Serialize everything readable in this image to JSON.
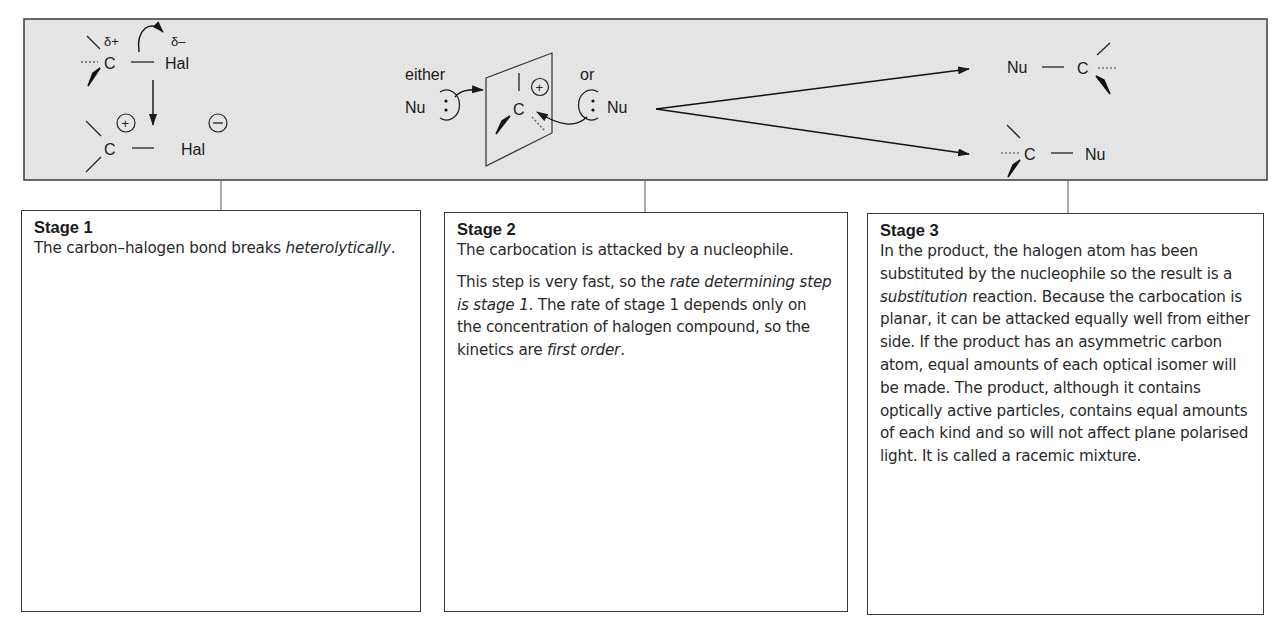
{
  "mechanism": {
    "colors": {
      "panel_bg": "#e6e6e6",
      "line": "#2a2a2a",
      "box_border": "#3a3a3a",
      "text": "#2a2a2a"
    },
    "stage1_diagram": {
      "delta_plus": "δ+",
      "delta_minus": "δ–",
      "carbon": "C",
      "halogen": "Hal",
      "carbon_ion": "C",
      "halide_ion": "Hal",
      "plus_sign": "+",
      "minus_sign": "−"
    },
    "stage2_diagram": {
      "either_label": "either",
      "or_label": "or",
      "nucleophile_left": "Nu",
      "nucleophile_right": "Nu",
      "carbocation": "C",
      "plus_sign": "+",
      "lone_pair": ":"
    },
    "stage3_diagram": {
      "product_top_nu": "Nu",
      "product_top_c": "C",
      "product_bottom_c": "C",
      "product_bottom_nu": "Nu"
    }
  },
  "stages": [
    {
      "title": "Stage 1",
      "paragraphs": [
        [
          {
            "text": "The carbon–halogen bond breaks ",
            "italic": false
          },
          {
            "text": "heterolytically",
            "italic": true
          },
          {
            "text": ".",
            "italic": false
          }
        ]
      ]
    },
    {
      "title": "Stage 2",
      "paragraphs": [
        [
          {
            "text": "The carbocation is attacked by a nucleophile.",
            "italic": false
          }
        ],
        [
          {
            "text": "This step is very fast, so the ",
            "italic": false
          },
          {
            "text": "rate determining step is stage 1",
            "italic": true
          },
          {
            "text": ". The rate of stage 1 depends only on the concentration of halogen compound, so the kinetics are ",
            "italic": false
          },
          {
            "text": "first order",
            "italic": true
          },
          {
            "text": ".",
            "italic": false
          }
        ]
      ]
    },
    {
      "title": "Stage 3",
      "paragraphs": [
        [
          {
            "text": "In the product, the halogen atom has been substituted by the nucleophile so the result is a ",
            "italic": false
          },
          {
            "text": "substitution",
            "italic": true
          },
          {
            "text": " reaction. Because the carbocation is planar, it can be attacked equally well from either side. If the product has an asymmetric carbon atom, equal amounts of each optical isomer will be made. The product, although it contains optically active particles, contains equal amounts of each kind and so will not affect plane polarised light. It is called a racemic mixture.",
            "italic": false
          }
        ]
      ]
    }
  ]
}
